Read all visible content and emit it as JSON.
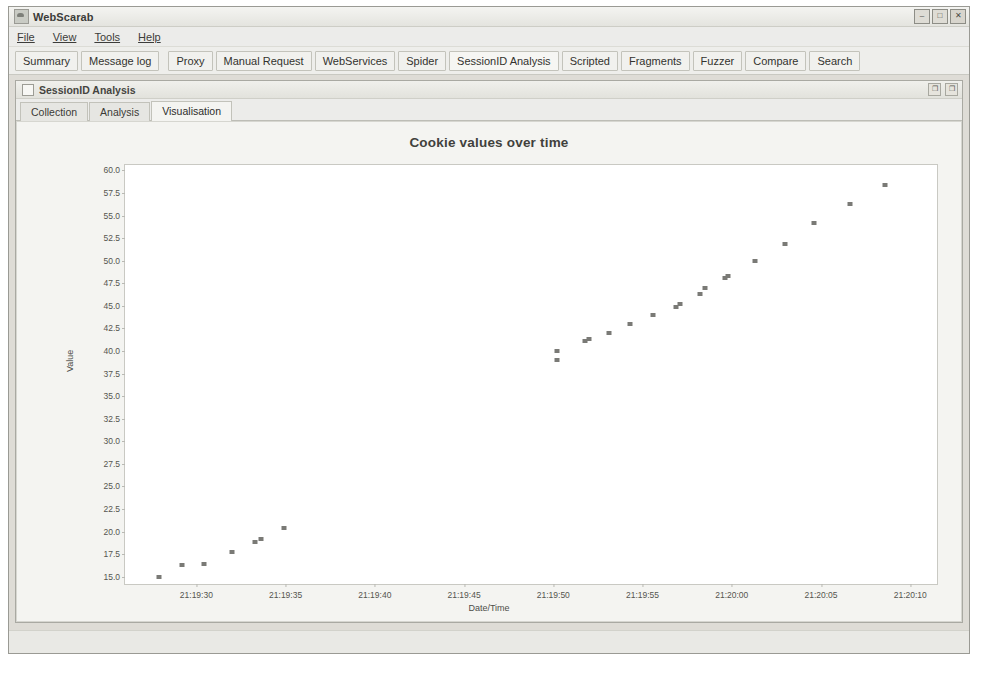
{
  "window": {
    "title": "WebScarab",
    "icon": "scarab-icon",
    "controls": [
      {
        "name": "minimize-button",
        "glyph": "–"
      },
      {
        "name": "maximize-button",
        "glyph": "□"
      },
      {
        "name": "close-button",
        "glyph": "✕"
      }
    ]
  },
  "menubar": {
    "items": [
      {
        "label": "File",
        "mnemonic": "F"
      },
      {
        "label": "View",
        "mnemonic": "V"
      },
      {
        "label": "Tools",
        "mnemonic": "T"
      },
      {
        "label": "Help",
        "mnemonic": "H"
      }
    ]
  },
  "tabs": {
    "selected": "SessionID Analysis",
    "items": [
      {
        "label": "Summary"
      },
      {
        "label": "Message log"
      },
      {
        "label": "Proxy"
      },
      {
        "label": "Manual Request"
      },
      {
        "label": "WebServices"
      },
      {
        "label": "Spider"
      },
      {
        "label": "SessionID Analysis"
      },
      {
        "label": "Scripted"
      },
      {
        "label": "Fragments"
      },
      {
        "label": "Fuzzer"
      },
      {
        "label": "Compare"
      },
      {
        "label": "Search"
      }
    ]
  },
  "internal_frame": {
    "title": "SessionID Analysis",
    "buttons": [
      {
        "name": "restore-button",
        "glyph": "❐"
      },
      {
        "name": "maximize-button",
        "glyph": "❐"
      }
    ]
  },
  "subtabs": {
    "active": "Visualisation",
    "items": [
      {
        "label": "Collection"
      },
      {
        "label": "Analysis"
      },
      {
        "label": "Visualisation"
      }
    ]
  },
  "statusbar": {
    "text": ""
  },
  "chart_data": {
    "type": "scatter",
    "title": "Cookie values over time",
    "xlabel": "Date/Time",
    "ylabel": "Value",
    "grid": false,
    "legend": false,
    "marker_color": "#7a7a76",
    "plot_background": "#ffffff",
    "ylim": [
      14.2,
      60.6
    ],
    "yticks": [
      60.0,
      57.5,
      55.0,
      52.5,
      50.0,
      47.5,
      45.0,
      42.5,
      40.0,
      37.5,
      35.0,
      32.5,
      30.0,
      27.5,
      25.0,
      22.5,
      20.0,
      17.5,
      15.0
    ],
    "xlim_seconds": [
      1165245,
      1165290
    ],
    "xticks": [
      {
        "label": "21:19:30",
        "seconds": 1165170
      },
      {
        "label": "21:19:35",
        "seconds": 1165175
      },
      {
        "label": "21:19:40",
        "seconds": 1165180
      },
      {
        "label": "21:19:45",
        "seconds": 1165185
      },
      {
        "label": "21:19:50",
        "seconds": 1165190
      },
      {
        "label": "21:19:55",
        "seconds": 1165195
      },
      {
        "label": "21:20:00",
        "seconds": 1165200
      },
      {
        "label": "21:20:05",
        "seconds": 1165205
      },
      {
        "label": "21:20:10",
        "seconds": 1165210
      }
    ],
    "xtick_seconds_base": 1165170,
    "x_axis_range_seconds": [
      1165166.0,
      1165211.5
    ],
    "points": [
      {
        "t": "21:19:27.9",
        "x": 1165167.9,
        "y": 15.0
      },
      {
        "t": "21:19:29.2",
        "x": 1165169.2,
        "y": 16.3
      },
      {
        "t": "21:19:30.4",
        "x": 1165170.4,
        "y": 16.4
      },
      {
        "t": "21:19:32.0",
        "x": 1165172.0,
        "y": 17.7
      },
      {
        "t": "21:19:33.3",
        "x": 1165173.3,
        "y": 18.9
      },
      {
        "t": "21:19:33.6",
        "x": 1165173.6,
        "y": 19.2
      },
      {
        "t": "21:19:34.9",
        "x": 1165174.9,
        "y": 20.4
      },
      {
        "t": "21:19:50.2",
        "x": 1165190.2,
        "y": 39.0
      },
      {
        "t": "21:19:50.2",
        "x": 1165190.2,
        "y": 40.0
      },
      {
        "t": "21:19:51.8",
        "x": 1165191.8,
        "y": 41.1
      },
      {
        "t": "21:19:52.0",
        "x": 1165192.0,
        "y": 41.3
      },
      {
        "t": "21:19:53.1",
        "x": 1165193.1,
        "y": 42.0
      },
      {
        "t": "21:19:54.3",
        "x": 1165194.3,
        "y": 43.0
      },
      {
        "t": "21:19:55.6",
        "x": 1165195.6,
        "y": 44.0
      },
      {
        "t": "21:19:56.9",
        "x": 1165196.9,
        "y": 44.9
      },
      {
        "t": "21:19:57.1",
        "x": 1165197.1,
        "y": 45.2
      },
      {
        "t": "21:19:58.2",
        "x": 1165198.2,
        "y": 46.3
      },
      {
        "t": "21:19:58.5",
        "x": 1165198.5,
        "y": 47.0
      },
      {
        "t": "21:19:59.6",
        "x": 1165199.6,
        "y": 48.1
      },
      {
        "t": "21:19:59.8",
        "x": 1165199.8,
        "y": 48.3
      },
      {
        "t": "21:20:01.3",
        "x": 1165201.3,
        "y": 50.0
      },
      {
        "t": "21:20:03.0",
        "x": 1165203.0,
        "y": 51.9
      },
      {
        "t": "21:20:04.6",
        "x": 1165204.6,
        "y": 54.2
      },
      {
        "t": "21:20:06.6",
        "x": 1165206.6,
        "y": 56.3
      },
      {
        "t": "21:20:08.6",
        "x": 1165208.6,
        "y": 58.4
      }
    ]
  }
}
